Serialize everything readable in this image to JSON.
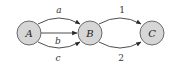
{
  "diagram": {
    "type": "directed-multigraph",
    "nodes": [
      {
        "id": "A",
        "label": "A"
      },
      {
        "id": "B",
        "label": "B"
      },
      {
        "id": "C",
        "label": "C"
      }
    ],
    "edges": [
      {
        "from": "A",
        "to": "B",
        "label": "a"
      },
      {
        "from": "A",
        "to": "B",
        "label": "b"
      },
      {
        "from": "A",
        "to": "B",
        "label": "c"
      },
      {
        "from": "B",
        "to": "C",
        "label": "1"
      },
      {
        "from": "B",
        "to": "C",
        "label": "2"
      }
    ],
    "colors": {
      "node_fill": "#d6d6d6",
      "node_stroke": "#6a6a6a",
      "edge": "#3a3a3a"
    }
  }
}
